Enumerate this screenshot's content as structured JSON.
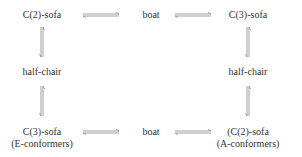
{
  "diagram": {
    "nodes": {
      "top_left": "C(2)-sofa",
      "top_center": "boat",
      "top_right": "C(3)-sofa",
      "mid_left": "half-chair",
      "mid_right": "half-chair",
      "bottom_left": "C(3)-sofa",
      "bottom_left_sub": "(E-conformers)",
      "bottom_center": "boat",
      "bottom_right": "(C(2)-sofa",
      "bottom_right_sub": "(A-conformers)"
    },
    "arrow_type": "equilibrium",
    "colors": {
      "text": "#333333",
      "arrow": "#777777"
    }
  }
}
